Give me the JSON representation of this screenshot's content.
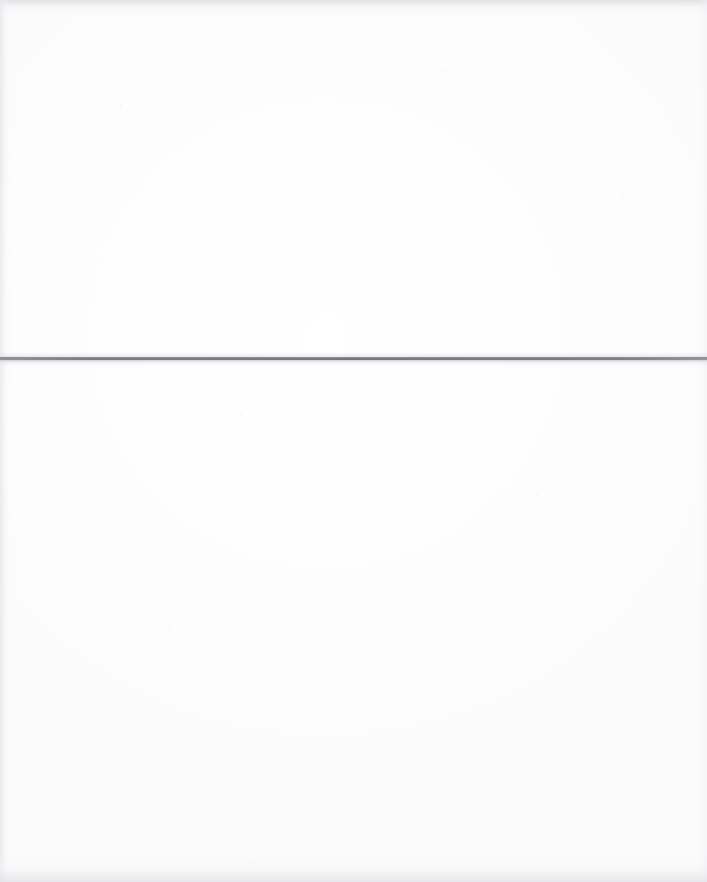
{
  "document": {
    "kind": "scanned-blank-page",
    "width": 707,
    "height": 882,
    "background_color": "#fdfdfd",
    "text_content": "",
    "caption": ""
  },
  "rule": {
    "label": "",
    "orientation": "horizontal",
    "color": "#7e7e87",
    "thickness_px": 3,
    "y_position_px": 358,
    "x_start_px": 0,
    "x_end_px": 707,
    "spans_full_width": true
  },
  "regions": {
    "upper": {
      "label": "",
      "content": ""
    },
    "lower": {
      "label": "",
      "content": ""
    }
  },
  "edges": {
    "top_shadow_color": "#dedee2",
    "bottom_shadow_color": "#e4e4e8",
    "left_shadow_color": "#e7e7eb",
    "right_shadow_color": "#f0f0f3"
  }
}
